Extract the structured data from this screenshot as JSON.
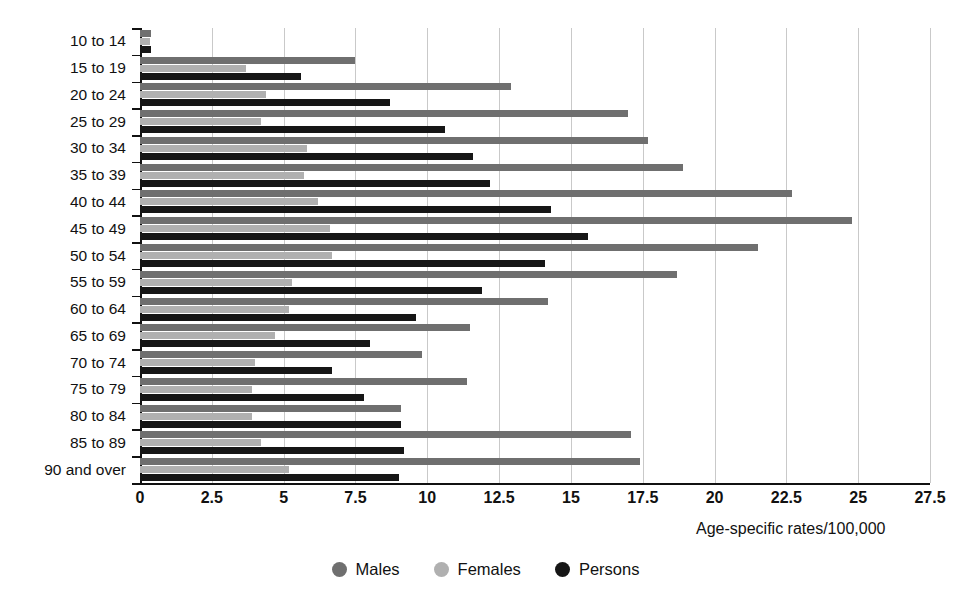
{
  "chart_data": {
    "type": "bar",
    "orientation": "horizontal",
    "title": "",
    "xlabel": "Age-specific rates/100,000",
    "ylabel": "",
    "xlim": [
      0,
      27.5
    ],
    "xticks": [
      "0",
      "2.5",
      "5",
      "7.5",
      "10",
      "12.5",
      "15",
      "17.5",
      "20",
      "22.5",
      "25",
      "27.5"
    ],
    "xtick_values": [
      0,
      2.5,
      5,
      7.5,
      10,
      12.5,
      15,
      17.5,
      20,
      22.5,
      25,
      27.5
    ],
    "grid": true,
    "legend_position": "bottom",
    "categories": [
      "10 to 14",
      "15 to 19",
      "20 to 24",
      "25 to 29",
      "30 to 34",
      "35 to 39",
      "40 to 44",
      "45 to 49",
      "50 to 54",
      "55 to 59",
      "60 to 64",
      "65 to 69",
      "70 to 74",
      "75 to 79",
      "80 to 84",
      "85 to 89",
      "90 and over"
    ],
    "series": [
      {
        "name": "Males",
        "color": "#6f6f6f",
        "values": [
          0.4,
          7.5,
          12.9,
          17.0,
          17.7,
          18.9,
          22.7,
          24.8,
          21.5,
          18.7,
          14.2,
          11.5,
          9.8,
          11.4,
          9.1,
          17.1,
          17.4
        ]
      },
      {
        "name": "Females",
        "color": "#b0b0b0",
        "values": [
          0.35,
          3.7,
          4.4,
          4.2,
          5.8,
          5.7,
          6.2,
          6.6,
          6.7,
          5.3,
          5.2,
          4.7,
          4.0,
          3.9,
          3.9,
          4.2,
          5.2
        ]
      },
      {
        "name": "Persons",
        "color": "#161616",
        "values": [
          0.4,
          5.6,
          8.7,
          10.6,
          11.6,
          12.2,
          14.3,
          15.6,
          14.1,
          11.9,
          9.6,
          8.0,
          6.7,
          7.8,
          9.1,
          9.2,
          9.0
        ]
      }
    ]
  },
  "legend": {
    "items": [
      {
        "label": "Males",
        "color": "#6f6f6f"
      },
      {
        "label": "Females",
        "color": "#b0b0b0"
      },
      {
        "label": "Persons",
        "color": "#161616"
      }
    ]
  },
  "axis": {
    "x_title": "Age-specific rates/100,000"
  }
}
